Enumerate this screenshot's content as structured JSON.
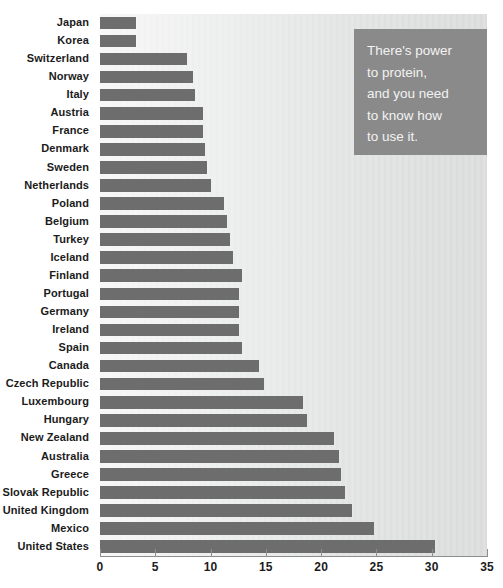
{
  "chart_data": {
    "type": "bar",
    "orientation": "horizontal",
    "title": "",
    "xlabel": "",
    "ylabel": "",
    "xlim": [
      0,
      35
    ],
    "xticks": [
      0,
      5,
      10,
      15,
      20,
      25,
      30,
      35
    ],
    "xtick_labels": [
      "0",
      "5",
      "10",
      "15",
      "20",
      "25",
      "30",
      "35"
    ],
    "grid": false,
    "legend": null,
    "bar_color": "#6d6d6d",
    "categories": [
      "Japan",
      "Korea",
      "Switzerland",
      "Norway",
      "Italy",
      "Austria",
      "France",
      "Denmark",
      "Sweden",
      "Netherlands",
      "Poland",
      "Belgium",
      "Turkey",
      "Iceland",
      "Finland",
      "Portugal",
      "Germany",
      "Ireland",
      "Spain",
      "Canada",
      "Czech Republic",
      "Luxembourg",
      "Hungary",
      "New Zealand",
      "Australia",
      "Greece",
      "Slovak Republic",
      "United Kingdom",
      "Mexico",
      "United States"
    ],
    "values": [
      3.3,
      3.3,
      7.9,
      8.4,
      8.6,
      9.3,
      9.3,
      9.5,
      9.7,
      10.0,
      11.2,
      11.5,
      11.8,
      12.0,
      12.8,
      12.6,
      12.6,
      12.6,
      12.8,
      14.4,
      14.8,
      18.4,
      18.7,
      21.2,
      21.6,
      21.8,
      22.2,
      22.8,
      24.8,
      30.3
    ]
  },
  "callout": {
    "text": "There's power\nto protein,\nand you need\nto know how\nto use it.",
    "background_color": "#8a8a8a",
    "text_color": "#f2f2f2"
  }
}
